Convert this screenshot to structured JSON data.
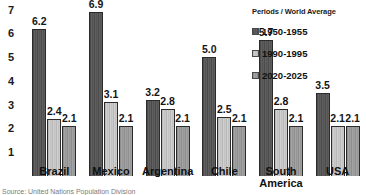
{
  "chart_data": {
    "type": "bar",
    "title": "",
    "subtitle": "",
    "xlabel": "",
    "ylabel": "",
    "ylim": [
      0,
      7.4
    ],
    "grid": false,
    "legend_position": "top-right",
    "categories": [
      "Brazil",
      "Mexico",
      "Argentina",
      "Chile",
      "South America",
      "USA"
    ],
    "series": [
      {
        "name": "1950-1955",
        "values": [
          6.2,
          6.9,
          3.2,
          5.0,
          5.7,
          3.5
        ]
      },
      {
        "name": "1990-1995",
        "values": [
          2.4,
          3.1,
          2.8,
          2.5,
          2.8,
          2.1
        ]
      },
      {
        "name": "2020-2025",
        "values": [
          2.1,
          2.1,
          2.1,
          2.1,
          2.1,
          2.1
        ]
      }
    ],
    "y_ticks": [
      "7",
      "6",
      "5",
      "4",
      "3",
      "2",
      "1"
    ],
    "y_tick_values": [
      7,
      6,
      5,
      4,
      3,
      2,
      1
    ],
    "data_labels": [
      [
        "6.2",
        "2.4",
        "2.1"
      ],
      [
        "6.9",
        "3.1",
        "2.1"
      ],
      [
        "3.2",
        "2.8",
        "2.1"
      ],
      [
        "5.0",
        "2.5",
        "2.1"
      ],
      [
        "5.7",
        "2.8",
        "2.1"
      ],
      [
        "3.5",
        "2.1",
        "2.1"
      ]
    ],
    "category_label_lines": [
      [
        "Brazil"
      ],
      [
        "Mexico"
      ],
      [
        "Argentina"
      ],
      [
        "Chile"
      ],
      [
        "South",
        "America"
      ],
      [
        "USA"
      ]
    ],
    "colors": [
      "#545454",
      "#c4c4c4",
      "#989898"
    ]
  },
  "legend": {
    "title": "Periods / World Average",
    "items": [
      {
        "label": "1950-1955"
      },
      {
        "label": "1990-1995"
      },
      {
        "label": "2020-2025"
      }
    ]
  },
  "footer": {
    "source": "Source: United Nations Population Division"
  }
}
